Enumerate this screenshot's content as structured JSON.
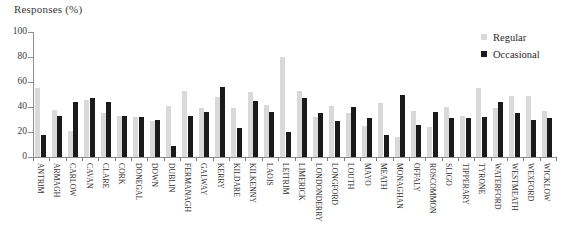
{
  "chart_data": {
    "type": "bar",
    "title": "Responses (%)",
    "xlabel": "",
    "ylabel": "Responses (%)",
    "ylim": [
      0,
      100
    ],
    "yticks": [
      0,
      20,
      40,
      60,
      80,
      100
    ],
    "grid": false,
    "legend_position": "top-right",
    "categories": [
      "ANTRIM",
      "ARMAGH",
      "CARLOW",
      "CAVAN",
      "CLARE",
      "CORK",
      "DONEGAL",
      "DOWN",
      "DUBLIN",
      "FERMANAGH",
      "GALWAY",
      "KERRY",
      "KILDARE",
      "KILKENNY",
      "LAOIS",
      "LEITRIM",
      "LIMERICK",
      "LONDONDERRY",
      "LONGFORD",
      "LOUTH",
      "MAYO",
      "MEATH",
      "MONAGHAN",
      "OFFALY",
      "ROSCOMMON",
      "SLIGO",
      "TIPPERARY",
      "TYRONE",
      "WATERFORD",
      "WESTMEATH",
      "WEXFORD",
      "WICKLOW"
    ],
    "series": [
      {
        "name": "Regular",
        "color": "#d9d9d9",
        "values": [
          55,
          38,
          21,
          46,
          35,
          33,
          32,
          29,
          41,
          53,
          39,
          48,
          39,
          52,
          42,
          80,
          53,
          32,
          41,
          35,
          25,
          43,
          16,
          37,
          24,
          40,
          33,
          55,
          39,
          49,
          49,
          37
        ]
      },
      {
        "name": "Occasional",
        "color": "#1a1a1a",
        "values": [
          18,
          33,
          44,
          47,
          44,
          33,
          32,
          30,
          9,
          33,
          36,
          56,
          23,
          45,
          36,
          20,
          47,
          35,
          29,
          40,
          31,
          18,
          50,
          26,
          36,
          31,
          31,
          32,
          44,
          35,
          30,
          31
        ]
      }
    ]
  },
  "legend": {
    "items": [
      {
        "label": "Regular",
        "color": "#d9d9d9"
      },
      {
        "label": "Occasional",
        "color": "#1a1a1a"
      }
    ]
  }
}
